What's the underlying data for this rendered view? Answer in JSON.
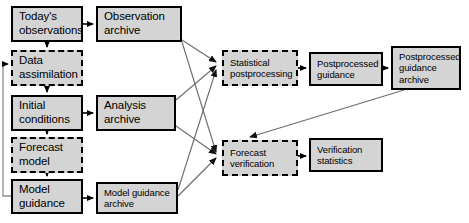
{
  "diagram": {
    "type": "flowchart",
    "canvas": {
      "width": 469,
      "height": 223
    },
    "style": {
      "node_fill": "#d4d4d4",
      "node_stroke": "#000000",
      "edge_stroke": "#555555",
      "background": "#ffffff"
    },
    "nodes": [
      {
        "id": "todays-observations",
        "label": "Today's\nobservations",
        "border": "solid",
        "text_size": "normal",
        "x": 11,
        "y": 6,
        "w": 72,
        "h": 36
      },
      {
        "id": "observation-archive",
        "label": "Observation\narchive",
        "border": "solid",
        "text_size": "normal",
        "x": 96,
        "y": 6,
        "w": 86,
        "h": 36
      },
      {
        "id": "data-assimilation",
        "label": "Data\nassimilation",
        "border": "dashed",
        "text_size": "normal",
        "x": 11,
        "y": 50,
        "w": 72,
        "h": 36
      },
      {
        "id": "initial-conditions",
        "label": "Initial\nconditions",
        "border": "solid",
        "text_size": "normal",
        "x": 11,
        "y": 95,
        "w": 72,
        "h": 36
      },
      {
        "id": "analysis-archive",
        "label": "Analysis\narchive",
        "border": "solid",
        "text_size": "normal",
        "x": 96,
        "y": 95,
        "w": 80,
        "h": 36
      },
      {
        "id": "forecast-model",
        "label": "Forecast\nmodel",
        "border": "dashed",
        "text_size": "normal",
        "x": 11,
        "y": 137,
        "w": 72,
        "h": 36
      },
      {
        "id": "model-guidance",
        "label": "Model\nguidance",
        "border": "solid",
        "text_size": "normal",
        "x": 11,
        "y": 179,
        "w": 72,
        "h": 35
      },
      {
        "id": "model-guidance-archive",
        "label": "Model guidance\narchive",
        "border": "solid",
        "text_size": "small",
        "x": 96,
        "y": 182,
        "w": 82,
        "h": 32
      },
      {
        "id": "statistical-postprocessing",
        "label": "Statistical\npostprocessing",
        "border": "dashed",
        "text_size": "small",
        "x": 222,
        "y": 50,
        "w": 76,
        "h": 36
      },
      {
        "id": "postprocessed-guidance",
        "label": "Postprocessed\nguidance",
        "border": "solid",
        "text_size": "small",
        "x": 309,
        "y": 52,
        "w": 74,
        "h": 34
      },
      {
        "id": "postprocessed-guidance-archive",
        "label": "Postprocessed\nguidance\narchive",
        "border": "solid",
        "text_size": "small",
        "x": 391,
        "y": 46,
        "w": 70,
        "h": 44
      },
      {
        "id": "forecast-verification",
        "label": "Forecast\nverification",
        "border": "dashed",
        "text_size": "small",
        "x": 222,
        "y": 140,
        "w": 76,
        "h": 36
      },
      {
        "id": "verification-statistics",
        "label": "Verification\nstatistics",
        "border": "solid",
        "text_size": "small",
        "x": 309,
        "y": 138,
        "w": 74,
        "h": 34
      }
    ],
    "edges": [
      {
        "from": "todays-observations",
        "to": "observation-archive",
        "kind": "arrow"
      },
      {
        "from": "todays-observations",
        "to": "data-assimilation",
        "kind": "arrow"
      },
      {
        "from": "data-assimilation",
        "to": "initial-conditions",
        "kind": "arrow"
      },
      {
        "from": "initial-conditions",
        "to": "analysis-archive",
        "kind": "arrow"
      },
      {
        "from": "initial-conditions",
        "to": "forecast-model",
        "kind": "arrow"
      },
      {
        "from": "forecast-model",
        "to": "model-guidance",
        "kind": "arrow"
      },
      {
        "from": "model-guidance",
        "to": "model-guidance-archive",
        "kind": "arrow"
      },
      {
        "from": "model-guidance",
        "to": "data-assimilation",
        "kind": "feedback-loop"
      },
      {
        "from": "observation-archive",
        "to": "statistical-postprocessing",
        "kind": "arrow"
      },
      {
        "from": "observation-archive",
        "to": "forecast-verification",
        "kind": "arrow"
      },
      {
        "from": "analysis-archive",
        "to": "statistical-postprocessing",
        "kind": "arrow"
      },
      {
        "from": "analysis-archive",
        "to": "forecast-verification",
        "kind": "arrow"
      },
      {
        "from": "model-guidance-archive",
        "to": "statistical-postprocessing",
        "kind": "arrow"
      },
      {
        "from": "model-guidance-archive",
        "to": "forecast-verification",
        "kind": "arrow"
      },
      {
        "from": "statistical-postprocessing",
        "to": "postprocessed-guidance",
        "kind": "arrow"
      },
      {
        "from": "postprocessed-guidance",
        "to": "postprocessed-guidance-archive",
        "kind": "arrow"
      },
      {
        "from": "postprocessed-guidance-archive",
        "to": "forecast-verification",
        "kind": "arrow"
      },
      {
        "from": "forecast-verification",
        "to": "verification-statistics",
        "kind": "arrow"
      }
    ]
  }
}
